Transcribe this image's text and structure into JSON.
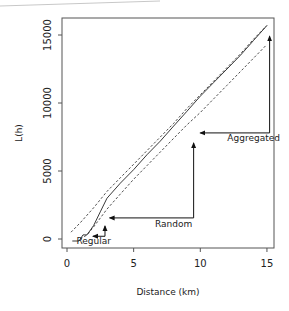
{
  "chart_data": {
    "type": "line",
    "title": "",
    "xlabel": "Distance (km)",
    "ylabel": "L(h)",
    "xlim": [
      0,
      15
    ],
    "ylim": [
      0,
      16000
    ],
    "xticks": [
      0,
      5,
      10,
      15
    ],
    "xtick_labels": [
      "0",
      "5",
      "10",
      "15"
    ],
    "yticks": [
      0,
      5000,
      10000,
      15000
    ],
    "ytick_labels": [
      "0",
      "5000",
      "10000",
      "15000"
    ],
    "grid": false,
    "legend": null,
    "series": [
      {
        "name": "Observed L(h)",
        "style": "solid",
        "x": [
          0.4,
          0.9,
          1.2,
          1.5,
          2.0,
          2.5,
          3.0,
          4.0,
          5.0,
          6.0,
          7.0,
          8.0,
          9.0,
          10.0,
          11.0,
          12.0,
          13.0,
          14.0,
          15.0
        ],
        "y": [
          -150,
          -150,
          300,
          300,
          1000,
          2000,
          3000,
          4100,
          5100,
          6200,
          7200,
          8300,
          9400,
          10500,
          11500,
          12500,
          13500,
          14600,
          15700
        ]
      },
      {
        "name": "Upper envelope",
        "style": "dashed",
        "x": [
          0.3,
          1.0,
          2.0,
          3.0,
          4.0,
          5.0,
          6.0,
          7.0,
          8.0,
          9.0,
          10.0,
          11.0,
          12.0,
          13.0,
          14.0,
          15.0
        ],
        "y": [
          500,
          1200,
          2300,
          3500,
          4500,
          5500,
          6500,
          7500,
          8500,
          9600,
          10600,
          11600,
          12600,
          13600,
          14700,
          15700
        ]
      },
      {
        "name": "Lower envelope",
        "style": "dashed",
        "x": [
          1.0,
          1.5,
          2.0,
          3.0,
          4.0,
          5.0,
          6.0,
          7.0,
          8.0,
          9.0,
          10.0,
          11.0,
          12.0,
          13.0,
          14.0,
          15.0
        ],
        "y": [
          0,
          300,
          900,
          2200,
          3300,
          4400,
          5400,
          6400,
          7400,
          8400,
          9300,
          10300,
          11300,
          12300,
          13300,
          14300
        ]
      }
    ],
    "annotations": [
      {
        "text": "Aggregated",
        "arrow_to": [
          10.0,
          7800
        ],
        "via": [
          15.2,
          7800
        ],
        "from": [
          15.2,
          14900
        ],
        "label_at": [
          14.0,
          7200
        ]
      },
      {
        "text": "Random",
        "arrow_to": [
          3.2,
          1550
        ],
        "via": [
          9.5,
          1550
        ],
        "from": [
          9.5,
          7050
        ],
        "label_at": [
          8.0,
          900
        ]
      },
      {
        "text": "Regular",
        "arrow_to": [
          1.95,
          200
        ],
        "via": [
          2.85,
          200
        ],
        "from": [
          2.85,
          950
        ],
        "label_at": [
          2.0,
          -350
        ]
      }
    ]
  }
}
